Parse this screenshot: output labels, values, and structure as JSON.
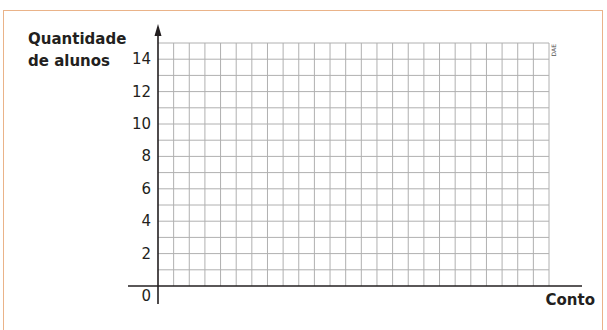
{
  "chart_data": {
    "type": "bar",
    "title": "",
    "xlabel": "Conto",
    "ylabel": "Quantidade de alunos",
    "ylabel_lines": [
      "Quantidade",
      "de alunos"
    ],
    "y_ticks": [
      "0",
      "2",
      "4",
      "6",
      "8",
      "10",
      "12",
      "14"
    ],
    "ylim": [
      0,
      15
    ],
    "grid": true,
    "grid_columns": 25,
    "grid_rows": 15,
    "categories": [],
    "values": [],
    "credit": "DAE",
    "note": "Empty grid for students to draw a bar chart"
  },
  "colors": {
    "border": "#eab389",
    "grid": "#b0b0b0",
    "axis": "#231f20"
  }
}
